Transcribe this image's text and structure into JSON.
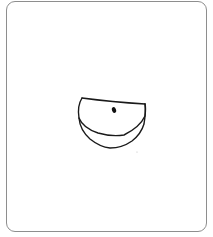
{
  "canvas": {
    "width": 213,
    "height": 237,
    "background": "#ffffff"
  },
  "frame": {
    "border_color": "#8e8e8e",
    "corner_radius": 9
  },
  "sketch": {
    "subject": "hand-drawn bowl / eye-like shape",
    "stroke_color": "#1a1a1a",
    "elements": [
      "top-edge-line",
      "inner-curve",
      "outer-curve",
      "center-dot",
      "stray-speck"
    ]
  }
}
